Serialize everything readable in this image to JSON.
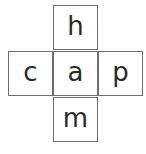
{
  "puzzle": {
    "cells": {
      "top": "h",
      "left": "c",
      "center": "a",
      "right": "p",
      "bottom": "m"
    },
    "border_color": "#6e6e6e",
    "text_color": "#2a2a2a"
  }
}
